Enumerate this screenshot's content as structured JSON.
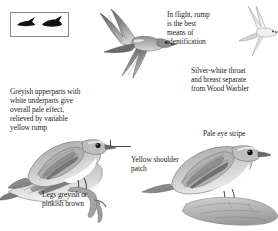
{
  "plate": {
    "title": "Bonelli's Warbler identification plate",
    "background_color": "#ffffff",
    "text_color": "#1c1c1c",
    "line_color": "#4a4a4a"
  },
  "silhouette_box": {
    "name": "flight-silhouette-box",
    "border_color": "#8a8a8a",
    "silhouette_count": 2,
    "silhouette_color": "#111111"
  },
  "annotations": [
    {
      "id": "upperparts",
      "text": "Greyish upperparts with\nwhite underparts give\noverall pale effect,\nrelieved by variable\nyellow rump"
    },
    {
      "id": "in-flight",
      "text": "In flight, rump\nis the best\nmeans of\nidentification"
    },
    {
      "id": "silver-throat",
      "text": "Silver-white throat\nand breast separate\nfrom Wood Warbler"
    },
    {
      "id": "yellow-shoulder",
      "text": "Yellow shoulder\npatch"
    },
    {
      "id": "legs",
      "text": "Legs greyish or\npinkish brown"
    },
    {
      "id": "pale-eye-stripe",
      "text": "Pale eye stripe"
    }
  ],
  "illustrations": [
    {
      "id": "flying-main",
      "label": "warbler-in-flight-upperside"
    },
    {
      "id": "flying-right",
      "label": "warbler-in-flight-underside"
    },
    {
      "id": "perched-center",
      "label": "warbler-perched-on-twig"
    },
    {
      "id": "perched-right",
      "label": "warbler-perched-on-rock"
    },
    {
      "id": "perched-left",
      "label": "warbler-perched-tail-view"
    }
  ]
}
